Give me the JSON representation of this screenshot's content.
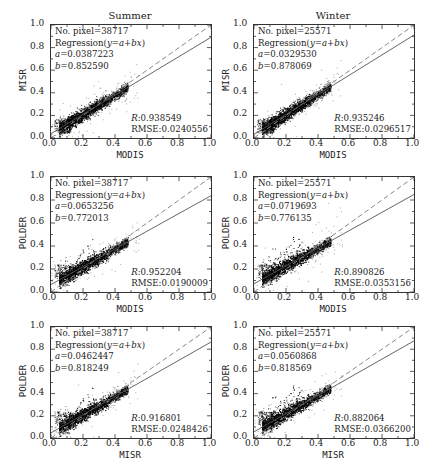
{
  "figure": {
    "column_titles": [
      "Summer",
      "Winter"
    ],
    "tick_labels": [
      "0.0",
      "0.2",
      "0.4",
      "0.6",
      "0.8",
      "1.0"
    ]
  },
  "panels": [
    {
      "id": "summer-misr-modis",
      "title": "Summer",
      "xlabel": "MODIS",
      "ylabel": "MISR",
      "npixel": "No. pixel=38717",
      "regression": "Regression(y=a+bx)",
      "a": "a=0.0387223",
      "b": "b=0.852590",
      "r": "R:0.938549",
      "rmse": "RMSE:0.0240556"
    },
    {
      "id": "winter-misr-modis",
      "title": "Winter",
      "xlabel": "MODIS",
      "ylabel": "MISR",
      "npixel": "No. pixel=25571",
      "regression": "Regression(y=a+bx)",
      "a": "a=0.0329530",
      "b": "b=0.878069",
      "r": "R:0.935246",
      "rmse": "RMSE:0.0296517"
    },
    {
      "id": "summer-polder-modis",
      "title": "",
      "xlabel": "MODIS",
      "ylabel": "POLDER",
      "npixel": "No. pixel=38717",
      "regression": "Regression(y=a+bx)",
      "a": "a=0.0653256",
      "b": "b=0.772013",
      "r": "R:0.952204",
      "rmse": "RMSE:0.0190009"
    },
    {
      "id": "winter-polder-modis",
      "title": "",
      "xlabel": "MODIS",
      "ylabel": "POLDER",
      "npixel": "No. pixel=25571",
      "regression": "Regression(y=a+bx)",
      "a": "a=0.0719693",
      "b": "b=0.776135",
      "r": "R:0.890826",
      "rmse": "RMSE:0.0353156"
    },
    {
      "id": "summer-polder-misr",
      "title": "",
      "xlabel": "MISR",
      "ylabel": "POLDER",
      "npixel": "No. pixel=38717",
      "regression": "Regression(y=a+bx)",
      "a": "a=0.0462447",
      "b": "b=0.818249",
      "r": "R:0.916801",
      "rmse": "RMSE:0.0248426"
    },
    {
      "id": "winter-polder-misr",
      "title": "",
      "xlabel": "MISR",
      "ylabel": "POLDER",
      "npixel": "No. pixel=25571",
      "regression": "Regression(y=a+bx)",
      "a": "a=0.0560868",
      "b": "b=0.818569",
      "r": "R:0.882064",
      "rmse": "RMSE:0.0366200"
    }
  ],
  "chart_data": [
    {
      "type": "scatter",
      "title": "Summer",
      "xlabel": "MODIS",
      "ylabel": "MISR",
      "xlim": [
        0,
        1
      ],
      "ylim": [
        0,
        1
      ],
      "ticks": [
        0,
        0.2,
        0.4,
        0.6,
        0.8,
        1.0
      ],
      "n_points": 38717,
      "regression": {
        "a": 0.0387223,
        "b": 0.85259
      },
      "R": 0.938549,
      "RMSE": 0.0240556,
      "lines": [
        "1:1 dashed",
        "regression solid"
      ],
      "data_extent": {
        "x": [
          0.02,
          0.48
        ],
        "y": [
          0.0,
          0.48
        ]
      }
    },
    {
      "type": "scatter",
      "title": "Winter",
      "xlabel": "MODIS",
      "ylabel": "MISR",
      "xlim": [
        0,
        1
      ],
      "ylim": [
        0,
        1
      ],
      "ticks": [
        0,
        0.2,
        0.4,
        0.6,
        0.8,
        1.0
      ],
      "n_points": 25571,
      "regression": {
        "a": 0.032953,
        "b": 0.878069
      },
      "R": 0.935246,
      "RMSE": 0.0296517,
      "lines": [
        "1:1 dashed",
        "regression solid"
      ],
      "data_extent": {
        "x": [
          0.02,
          0.5
        ],
        "y": [
          0.0,
          0.5
        ]
      }
    },
    {
      "type": "scatter",
      "title": "",
      "xlabel": "MODIS",
      "ylabel": "POLDER",
      "xlim": [
        0,
        1
      ],
      "ylim": [
        0,
        1
      ],
      "ticks": [
        0,
        0.2,
        0.4,
        0.6,
        0.8,
        1.0
      ],
      "n_points": 38717,
      "regression": {
        "a": 0.0653256,
        "b": 0.772013
      },
      "R": 0.952204,
      "RMSE": 0.0190009,
      "lines": [
        "1:1 dashed",
        "regression solid"
      ],
      "data_extent": {
        "x": [
          0.02,
          0.48
        ],
        "y": [
          0.05,
          0.48
        ]
      }
    },
    {
      "type": "scatter",
      "title": "",
      "xlabel": "MODIS",
      "ylabel": "POLDER",
      "xlim": [
        0,
        1
      ],
      "ylim": [
        0,
        1
      ],
      "ticks": [
        0,
        0.2,
        0.4,
        0.6,
        0.8,
        1.0
      ],
      "n_points": 25571,
      "regression": {
        "a": 0.0719693,
        "b": 0.776135
      },
      "R": 0.890826,
      "RMSE": 0.0353156,
      "lines": [
        "1:1 dashed",
        "regression solid"
      ],
      "data_extent": {
        "x": [
          0.02,
          0.5
        ],
        "y": [
          0.05,
          0.55
        ]
      }
    },
    {
      "type": "scatter",
      "title": "",
      "xlabel": "MISR",
      "ylabel": "POLDER",
      "xlim": [
        0,
        1
      ],
      "ylim": [
        0,
        1
      ],
      "ticks": [
        0,
        0.2,
        0.4,
        0.6,
        0.8,
        1.0
      ],
      "n_points": 38717,
      "regression": {
        "a": 0.0462447,
        "b": 0.818249
      },
      "R": 0.916801,
      "RMSE": 0.0248426,
      "lines": [
        "1:1 dashed",
        "regression solid"
      ],
      "data_extent": {
        "x": [
          0.02,
          0.5
        ],
        "y": [
          0.05,
          0.5
        ]
      }
    },
    {
      "type": "scatter",
      "title": "",
      "xlabel": "MISR",
      "ylabel": "POLDER",
      "xlim": [
        0,
        1
      ],
      "ylim": [
        0,
        1
      ],
      "ticks": [
        0,
        0.2,
        0.4,
        0.6,
        0.8,
        1.0
      ],
      "n_points": 25571,
      "regression": {
        "a": 0.0560868,
        "b": 0.818569
      },
      "R": 0.882064,
      "RMSE": 0.03662,
      "lines": [
        "1:1 dashed",
        "regression solid"
      ],
      "data_extent": {
        "x": [
          0.02,
          0.5
        ],
        "y": [
          0.05,
          0.55
        ]
      }
    }
  ]
}
